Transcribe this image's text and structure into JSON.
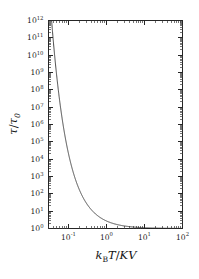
{
  "figure": {
    "background_color": "#ffffff",
    "curve_color": "#333333",
    "axis_color": "#262626",
    "text_color": "#1a1a1a"
  },
  "axes": {
    "x": {
      "title_parts": {
        "k": "k",
        "k_sub": "B",
        "T": "T",
        "slash": "/",
        "K": "K",
        "V": "V"
      },
      "title_plain": "kBT/KV",
      "scale": "log",
      "ticklabels": [
        {
          "base": "10",
          "exp": "-1"
        },
        {
          "base": "10",
          "exp": "0"
        },
        {
          "base": "10",
          "exp": "1"
        },
        {
          "base": "10",
          "exp": "2"
        }
      ]
    },
    "y": {
      "title_parts": {
        "tau": "τ",
        "slash": "/",
        "tau0": "τ",
        "tau0_sub": "0"
      },
      "title_plain": "τ/τ₀",
      "scale": "log",
      "ticklabels": [
        {
          "base": "10",
          "exp": "12"
        },
        {
          "base": "10",
          "exp": "11"
        },
        {
          "base": "10",
          "exp": "10"
        },
        {
          "base": "10",
          "exp": "9"
        },
        {
          "base": "10",
          "exp": "8"
        },
        {
          "base": "10",
          "exp": "7"
        },
        {
          "base": "10",
          "exp": "6"
        },
        {
          "base": "10",
          "exp": "5"
        },
        {
          "base": "10",
          "exp": "4"
        },
        {
          "base": "10",
          "exp": "3"
        },
        {
          "base": "10",
          "exp": "2"
        },
        {
          "base": "10",
          "exp": "1"
        },
        {
          "base": "10",
          "exp": "0"
        }
      ]
    }
  },
  "chart_data": {
    "type": "line",
    "title": "",
    "xlabel": "kBT/KV",
    "ylabel": "tau/tau_0",
    "xscale": "log",
    "yscale": "log",
    "xlim": [
      0.03,
      100
    ],
    "ylim": [
      1,
      1000000000000
    ],
    "grid": false,
    "legend": null,
    "series": [
      {
        "name": "Neel-Arrhenius relaxation time",
        "formula": "tau/tau_0 = exp(KV / kB T)",
        "x": [
          0.0362,
          0.04,
          0.045,
          0.05,
          0.055,
          0.06,
          0.065,
          0.07,
          0.08,
          0.09,
          0.1,
          0.12,
          0.14,
          0.16,
          0.18,
          0.2,
          0.25,
          0.3,
          0.35,
          0.4,
          0.5,
          0.6,
          0.7,
          0.8,
          0.9,
          1.0,
          1.25,
          1.5,
          2.0,
          2.5,
          3.0,
          4.0,
          5.0,
          7.0,
          10.0,
          15.0,
          20.0,
          30.0,
          50.0,
          70.0,
          100.0
        ],
        "y": [
          1000000000000.0,
          72000000000.0,
          2600000000.0,
          485000000.0,
          100000000.0,
          43000000.0,
          2000000.0,
          1290000.0,
          268000.0,
          54000.0,
          22000.0,
          3650.0,
          1230.0,
          536.0,
          257.0,
          148.0,
          54.6,
          28.0,
          17.5,
          12.2,
          7.39,
          5.29,
          4.17,
          3.49,
          3.04,
          2.72,
          2.23,
          1.95,
          1.65,
          1.49,
          1.4,
          1.28,
          1.22,
          1.15,
          1.11,
          1.07,
          1.05,
          1.03,
          1.02,
          1.014,
          1.01
        ]
      }
    ]
  }
}
